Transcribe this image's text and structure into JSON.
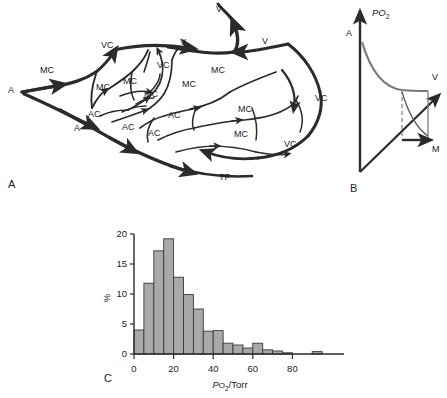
{
  "figure": {
    "panels": [
      {
        "id": "A",
        "label": "A"
      },
      {
        "id": "B",
        "label": "B"
      },
      {
        "id": "C",
        "label": "C"
      }
    ]
  },
  "panelA": {
    "label": "A",
    "description": "Microvascular network schematic",
    "vessel_labels": [
      {
        "text": "A",
        "x": 8,
        "y": 93
      },
      {
        "text": "MC",
        "x": 40,
        "y": 73
      },
      {
        "text": "VC",
        "x": 101,
        "y": 48
      },
      {
        "text": "V",
        "x": 180,
        "y": 45
      },
      {
        "text": "V",
        "x": 216,
        "y": 12
      },
      {
        "text": "V",
        "x": 262,
        "y": 44
      },
      {
        "text": "VC",
        "x": 157,
        "y": 68
      },
      {
        "text": "MC",
        "x": 123,
        "y": 84
      },
      {
        "text": "MC",
        "x": 102,
        "y": 90
      },
      {
        "text": "MC",
        "x": 147,
        "y": 97
      },
      {
        "text": "MC",
        "x": 185,
        "y": 87
      },
      {
        "text": "MC",
        "x": 213,
        "y": 73
      },
      {
        "text": "MC",
        "x": 102,
        "y": 89
      },
      {
        "text": "MC",
        "x": 240,
        "y": 112
      },
      {
        "text": "MC",
        "x": 236,
        "y": 137
      },
      {
        "text": "VC",
        "x": 317,
        "y": 101
      },
      {
        "text": "VC",
        "x": 286,
        "y": 147
      },
      {
        "text": "AC",
        "x": 93,
        "y": 117
      },
      {
        "text": "AC",
        "x": 126,
        "y": 128
      },
      {
        "text": "AC",
        "x": 152,
        "y": 133
      },
      {
        "text": "AC",
        "x": 172,
        "y": 118
      },
      {
        "text": "A",
        "x": 78,
        "y": 130
      },
      {
        "text": "TF",
        "x": 222,
        "y": 177
      }
    ]
  },
  "panelB": {
    "label": "B",
    "description": "PO2 gradient schematic along capillary",
    "axis_label": "PO",
    "axis_label_sub": "2",
    "points": [
      {
        "text": "A",
        "x": 8,
        "y": 33
      },
      {
        "text": "V",
        "x": 93,
        "y": 73
      },
      {
        "text": "M",
        "x": 92,
        "y": 148
      }
    ]
  },
  "panelC": {
    "label": "C",
    "ylabel": "%",
    "xlabel_main": "P",
    "xlabel_sub": "O",
    "xlabel_sub2": "2",
    "xlabel_tail": "/Torr"
  },
  "chart_data": {
    "type": "bar",
    "title": "",
    "xlabel": "PO2/Torr",
    "ylabel": "%",
    "xlim": [
      0,
      100
    ],
    "ylim": [
      0,
      20
    ],
    "xticks": [
      0,
      20,
      40,
      60,
      80
    ],
    "yticks": [
      0,
      5,
      10,
      15,
      20
    ],
    "grid": false,
    "bin_width": 5,
    "bin_starts": [
      0,
      5,
      10,
      15,
      20,
      25,
      30,
      35,
      40,
      45,
      50,
      55,
      60,
      65,
      70,
      75,
      80,
      85,
      90
    ],
    "categories": [
      "0-5",
      "5-10",
      "10-15",
      "15-20",
      "20-25",
      "25-30",
      "30-35",
      "35-40",
      "40-45",
      "45-50",
      "50-55",
      "55-60",
      "60-65",
      "65-70",
      "70-75",
      "75-80",
      "80-85",
      "85-90",
      "90-95"
    ],
    "values": [
      4.0,
      11.8,
      17.2,
      19.2,
      12.8,
      9.9,
      7.5,
      3.8,
      3.9,
      1.8,
      1.5,
      1.0,
      1.8,
      0.7,
      0.5,
      0.2,
      0.0,
      0.0,
      0.4
    ],
    "bar_fill": "#a9a9a9",
    "bar_stroke": "#3a3a3a"
  }
}
